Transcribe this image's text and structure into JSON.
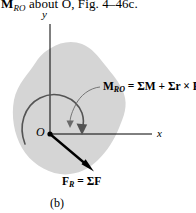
{
  "figure": {
    "caption_top": {
      "prefix_bold": "M",
      "prefix_sub": "R",
      "prefix_sub2": "O",
      "text": " about O, Fig. 4–46c."
    },
    "part_label": "(b)",
    "axes": {
      "y_label": "y",
      "x_label": "x",
      "origin_label": "O"
    },
    "moment": {
      "symbol": "M",
      "subscript": "R",
      "subscript2": "O",
      "equals": " = ",
      "sigma_m": "ΣM",
      "plus": " + ",
      "sigma_r": "Σr",
      "cross": " × ",
      "f": "F",
      "full_text": "M = ΣM + Σr × F"
    },
    "force": {
      "symbol": "F",
      "subscript": "R",
      "equals": " = ",
      "sigma_f": "ΣF",
      "full_text": "F = ΣF"
    },
    "colors": {
      "body_fill": "#d5d5d5",
      "line": "#000000",
      "arc": "#545454",
      "leader": "#6a6a6a",
      "background": "#ffffff"
    },
    "geometry": {
      "origin_x": 50,
      "origin_y": 134,
      "force_tip_x": 92,
      "force_tip_y": 170,
      "x_axis_end": 152,
      "y_axis_top": 24
    }
  }
}
